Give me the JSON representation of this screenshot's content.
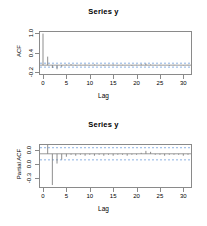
{
  "figure": {
    "background": "#ffffff",
    "axis_color": "#8a8a8a",
    "spike_color": "#7a7a7a",
    "conf_color": "#5a8fd6",
    "width": 207,
    "height": 226
  },
  "panels": [
    {
      "id": "acf",
      "title": "Series  y",
      "ylabel": "ACF",
      "xlabel": "Lag",
      "yticks": [
        "1.0",
        "0.4",
        "-0.2"
      ],
      "ytick_values": [
        1.0,
        0.4,
        -0.2
      ],
      "xticks": [
        "0",
        "5",
        "10",
        "15",
        "20",
        "25",
        "30"
      ],
      "xtick_values": [
        0,
        5,
        10,
        15,
        20,
        25,
        30
      ]
    },
    {
      "id": "pacf",
      "title": "Series  y",
      "ylabel": "Partial ACF",
      "xlabel": "Lag",
      "yticks": [
        "0.0",
        "0.0",
        "-0.3"
      ],
      "ytick_values": [
        0.0,
        0.0,
        -0.3
      ],
      "xticks": [
        "0",
        "5",
        "10",
        "15",
        "20",
        "25",
        "30"
      ],
      "xtick_values": [
        0,
        5,
        10,
        15,
        20,
        25,
        30
      ]
    }
  ],
  "chart_data": [
    {
      "type": "bar",
      "id": "acf-plot",
      "title": "Series  y",
      "xlabel": "Lag",
      "ylabel": "ACF",
      "xlim": [
        0,
        31
      ],
      "ylim": [
        -0.28,
        1.05
      ],
      "grid": false,
      "legend": null,
      "conf_bounds": [
        0.062,
        -0.062
      ],
      "conf_style": "dashed blue horizontal lines",
      "zero_line": 0.0,
      "x": [
        0,
        1,
        2,
        3,
        4,
        5,
        6,
        7,
        8,
        9,
        10,
        11,
        12,
        13,
        14,
        15,
        16,
        17,
        18,
        19,
        20,
        21,
        22,
        23,
        24,
        25,
        26,
        27,
        28,
        29,
        30,
        31
      ],
      "values": [
        1.0,
        0.27,
        -0.09,
        -0.13,
        -0.05,
        0.02,
        0.03,
        -0.02,
        0.01,
        0.02,
        -0.01,
        0.02,
        0.0,
        -0.02,
        0.01,
        0.02,
        -0.01,
        0.01,
        0.0,
        -0.02,
        0.01,
        0.03,
        0.05,
        0.02,
        -0.01,
        0.01,
        0.0,
        -0.02,
        0.01,
        0.0,
        -0.01,
        0.01
      ]
    },
    {
      "type": "bar",
      "id": "pacf-plot",
      "title": "Series  y",
      "xlabel": "Lag",
      "ylabel": "Partial ACF",
      "xlim": [
        0,
        31
      ],
      "ylim": [
        -0.34,
        0.09
      ],
      "grid": false,
      "legend": null,
      "conf_bounds": [
        0.062,
        -0.062
      ],
      "conf_style": "dashed blue horizontal lines",
      "zero_line": 0.0,
      "x": [
        1,
        2,
        3,
        4,
        5,
        6,
        7,
        8,
        9,
        10,
        11,
        12,
        13,
        14,
        15,
        16,
        17,
        18,
        19,
        20,
        21,
        22,
        23,
        24,
        25,
        26,
        27,
        28,
        29,
        30,
        31
      ],
      "values": [
        0.27,
        -0.32,
        -0.1,
        -0.06,
        -0.03,
        -0.01,
        -0.02,
        -0.01,
        -0.02,
        -0.01,
        -0.02,
        -0.01,
        -0.02,
        -0.01,
        -0.02,
        -0.01,
        -0.01,
        -0.02,
        -0.01,
        -0.01,
        0.01,
        0.03,
        0.02,
        -0.01,
        -0.01,
        -0.02,
        -0.01,
        -0.01,
        -0.01,
        -0.02,
        -0.01
      ]
    }
  ]
}
